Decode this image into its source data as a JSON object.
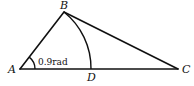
{
  "diagram": {
    "type": "geometry-triangle",
    "points": {
      "A": {
        "label": "A"
      },
      "B": {
        "label": "B"
      },
      "C": {
        "label": "C"
      },
      "D": {
        "label": "D"
      }
    },
    "segments": [
      "AB",
      "BC",
      "AC"
    ],
    "arcs": [
      {
        "name": "arc-BD",
        "center": "A",
        "from": "B",
        "to": "D"
      },
      {
        "name": "angle-A-marker",
        "center": "A",
        "angle_label": "0.9rad"
      }
    ],
    "angle_label": "0.9rad",
    "angle_value_rad": 0.9
  }
}
